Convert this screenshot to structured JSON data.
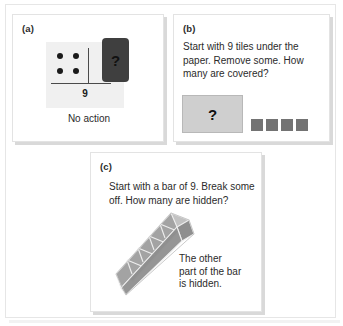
{
  "figure": {
    "panels": [
      {
        "id": "a",
        "label": "(a)",
        "card": {
          "total_label": "9",
          "dots_visible": 4,
          "hidden_card_symbol": "?",
          "hidden_card_color": "#3f3f3f"
        },
        "caption": "No action"
      },
      {
        "id": "b",
        "label": "(b)",
        "prompt": "Start with 9 tiles under the paper. Remove some. How many are covered?",
        "prompt_lines": [
          "Start with 9 tiles under the",
          "paper. Remove some. How",
          "many are covered?"
        ],
        "cover": {
          "symbol": "?",
          "color": "#cfcfcf"
        },
        "tiles": {
          "count": 4,
          "color": "#737373"
        }
      },
      {
        "id": "c",
        "label": "(c)",
        "prompt": "Start with a bar of 9. Break some off. How many are hidden?",
        "prompt_lines": [
          "Start with a bar of 9. Break some",
          "off. How many are hidden?"
        ],
        "bar": {
          "segments": 5,
          "orientation": "diagonal",
          "color": "#a8a8a8"
        },
        "note_lines": [
          "The other",
          "part of the bar",
          "is hidden."
        ]
      }
    ]
  },
  "colors": {
    "frame_border": "#e6e6e6",
    "panel_border": "#e3e3e3",
    "panel_shadow": "#d9d9d9",
    "text": "#2b2b2b",
    "card_background": "#f0f0f0",
    "dot": "#1a1a1a"
  }
}
